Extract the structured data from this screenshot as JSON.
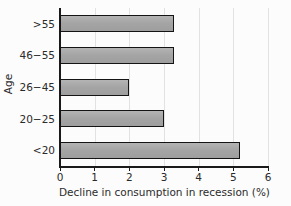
{
  "chart_data": {
    "type": "bar",
    "orientation": "horizontal",
    "title": "",
    "xlabel": "Decline in consumption in recession (%)",
    "ylabel": "Age",
    "categories": [
      ">55",
      "46−55",
      "26−45",
      "20−25",
      "<20"
    ],
    "values": [
      3.3,
      3.3,
      2.0,
      3.0,
      5.2
    ],
    "xlim": [
      0,
      6
    ],
    "xticks": [
      0,
      1,
      2,
      3,
      4,
      5,
      6
    ],
    "xticklabels": [
      "0",
      "1",
      "2",
      "3",
      "4",
      "5",
      "6"
    ],
    "grid": "vertical",
    "legend": "none",
    "bar_color": "#a8a8a8",
    "bar_edge_color": "#141414",
    "background_color": "#fcfcfc",
    "axis_color": "#1a1a1a",
    "gridline_color": "#e2e2e2"
  }
}
